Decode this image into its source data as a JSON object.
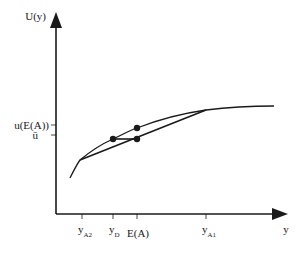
{
  "diagram": {
    "type": "expected-utility-concave-curve",
    "colors": {
      "ink": "#1a1a1a",
      "background": "#ffffff"
    },
    "axes": {
      "y_label": "U(y)",
      "x_label": "y",
      "y_ticks": [
        {
          "label": "u(E(A))",
          "name": "u-of-expected-a"
        },
        {
          "label": "ū",
          "name": "u-bar"
        }
      ],
      "x_ticks": [
        {
          "main": "y",
          "sub": "A2"
        },
        {
          "main": "y",
          "sub": "D"
        },
        {
          "main": "E(A)",
          "sub": ""
        },
        {
          "main": "y",
          "sub": "A1"
        }
      ]
    },
    "points": [
      {
        "name": "certainty-equivalent-point",
        "at": "(y_D, ū)"
      },
      {
        "name": "utility-of-expected-value-point",
        "at": "(E(A), u(E(A)))"
      },
      {
        "name": "expected-utility-point",
        "at": "(E(A), ū)"
      }
    ]
  }
}
